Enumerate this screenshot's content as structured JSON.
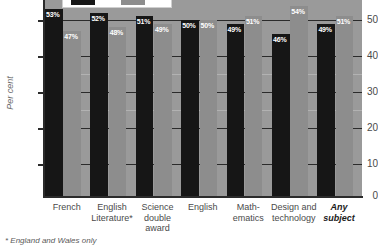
{
  "chart_data": {
    "type": "bar",
    "title": "",
    "xlabel": "",
    "ylabel": "Per cent",
    "ylim": [
      0,
      55
    ],
    "grid": true,
    "legend_position": "top",
    "categories": [
      "French",
      "English Literature*",
      "Science double award",
      "English",
      "Mathematics",
      "Design and technology",
      "Any subject"
    ],
    "category_lines": [
      [
        "French"
      ],
      [
        "English",
        "Literature*"
      ],
      [
        "Science",
        "double",
        "award"
      ],
      [
        "English"
      ],
      [
        "Math-",
        "ematics"
      ],
      [
        "Design and",
        "technology"
      ],
      [
        "Any",
        "subject"
      ]
    ],
    "series": [
      {
        "name": "series-1",
        "color": "#161616",
        "values": [
          53,
          52,
          51,
          50,
          49,
          46,
          49
        ]
      },
      {
        "name": "series-2",
        "color": "#8d8d8d",
        "values": [
          47,
          48,
          49,
          50,
          51,
          54,
          51
        ]
      }
    ],
    "bar_labels": [
      [
        "53%",
        "47%"
      ],
      [
        "52%",
        "48%"
      ],
      [
        "51%",
        "49%"
      ],
      [
        "50%",
        "50%"
      ],
      [
        "49%",
        "51%"
      ],
      [
        "46%",
        "54%"
      ],
      [
        "49%",
        "51%"
      ]
    ],
    "yticks": [
      0,
      10,
      20,
      30,
      40,
      50
    ],
    "ytick_labels": [
      "0",
      "10",
      "20",
      "30",
      "40",
      "50"
    ]
  },
  "axis": {
    "y_title": "Per cent",
    "ticks": [
      "50",
      "40",
      "30",
      "20",
      "10",
      "0"
    ]
  },
  "footnote": {
    "text": "* England and Wales only"
  },
  "legend": {
    "swatch_dark": "#161616",
    "swatch_gray": "#8d8d8d"
  },
  "colors": {
    "plot_background": "#9a9a9a",
    "axis": "#2b2b2b",
    "label_text": "#4a4a4a",
    "bar_label_text": "#ffffff"
  }
}
